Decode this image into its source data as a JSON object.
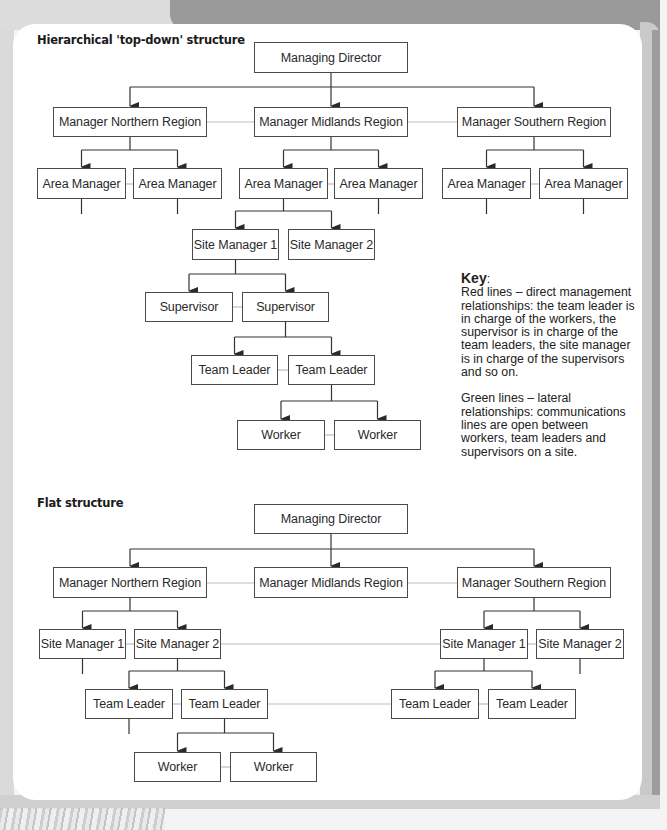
{
  "colors": {
    "direct_line": "#333333",
    "lateral_line": "#bdbdbd",
    "box_border": "#4a4a4a"
  },
  "hierarchical": {
    "title": "Hierarchical 'top-down' structure",
    "nodes": [
      {
        "id": "md",
        "label": "Managing Director",
        "x": 254,
        "y": 42,
        "w": 154,
        "h": 31
      },
      {
        "id": "north",
        "label": "Manager Northern Region",
        "x": 53,
        "y": 107,
        "w": 154,
        "h": 30
      },
      {
        "id": "mid",
        "label": "Manager Midlands Region",
        "x": 254,
        "y": 107,
        "w": 154,
        "h": 30
      },
      {
        "id": "south",
        "label": "Manager Southern Region",
        "x": 457,
        "y": 107,
        "w": 154,
        "h": 30
      },
      {
        "id": "n_am1",
        "label": "Area Manager",
        "x": 37,
        "y": 168,
        "w": 89,
        "h": 31
      },
      {
        "id": "n_am2",
        "label": "Area Manager",
        "x": 133,
        "y": 168,
        "w": 89,
        "h": 31
      },
      {
        "id": "m_am1",
        "label": "Area Manager",
        "x": 239,
        "y": 168,
        "w": 89,
        "h": 31
      },
      {
        "id": "m_am2",
        "label": "Area Manager",
        "x": 334,
        "y": 168,
        "w": 89,
        "h": 31
      },
      {
        "id": "s_am1",
        "label": "Area Manager",
        "x": 442,
        "y": 168,
        "w": 89,
        "h": 31
      },
      {
        "id": "s_am2",
        "label": "Area Manager",
        "x": 539,
        "y": 168,
        "w": 89,
        "h": 31
      },
      {
        "id": "sm1",
        "label": "Site Manager 1",
        "x": 192,
        "y": 229,
        "w": 87,
        "h": 31
      },
      {
        "id": "sm2",
        "label": "Site Manager 2",
        "x": 288,
        "y": 229,
        "w": 87,
        "h": 31
      },
      {
        "id": "sup1",
        "label": "Supervisor",
        "x": 145,
        "y": 292,
        "w": 88,
        "h": 30
      },
      {
        "id": "sup2",
        "label": "Supervisor",
        "x": 242,
        "y": 292,
        "w": 87,
        "h": 30
      },
      {
        "id": "tl1",
        "label": "Team Leader",
        "x": 191,
        "y": 355,
        "w": 87,
        "h": 30
      },
      {
        "id": "tl2",
        "label": "Team Leader",
        "x": 288,
        "y": 355,
        "w": 87,
        "h": 30
      },
      {
        "id": "w1",
        "label": "Worker",
        "x": 237,
        "y": 420,
        "w": 88,
        "h": 30
      },
      {
        "id": "w2",
        "label": "Worker",
        "x": 334,
        "y": 420,
        "w": 87,
        "h": 30
      }
    ],
    "direct_links": [
      {
        "from": "md",
        "to": [
          "north",
          "mid",
          "south"
        ],
        "bar_y": 87
      },
      {
        "from": "north",
        "to": [
          "n_am1",
          "n_am2"
        ],
        "bar_y": 150
      },
      {
        "from": "mid",
        "to": [
          "m_am1",
          "m_am2"
        ],
        "bar_y": 150
      },
      {
        "from": "south",
        "to": [
          "s_am1",
          "s_am2"
        ],
        "bar_y": 150
      },
      {
        "from": "m_am1",
        "to": [
          "sm1",
          "sm2"
        ],
        "bar_y": 211
      },
      {
        "from": "sm1",
        "to": [
          "sup1",
          "sup2"
        ],
        "bar_y": 274
      },
      {
        "from": "sup2",
        "to": [
          "tl1",
          "tl2"
        ],
        "bar_y": 337
      },
      {
        "from": "tl2",
        "to": [
          "w1",
          "w2"
        ],
        "bar_y": 401
      }
    ],
    "stubs": [
      "n_am1",
      "n_am2",
      "m_am2",
      "s_am1",
      "s_am2"
    ],
    "lateral_links": [
      [
        "north",
        "mid"
      ],
      [
        "mid",
        "south"
      ],
      [
        "n_am1",
        "n_am2"
      ],
      [
        "m_am1",
        "m_am2"
      ],
      [
        "s_am1",
        "s_am2"
      ],
      [
        "sup1",
        "sup2"
      ],
      [
        "tl1",
        "tl2"
      ],
      [
        "w1",
        "w2"
      ]
    ]
  },
  "key": {
    "title": "Key",
    "title_suffix": ":",
    "red_lines": "Red lines – direct management relationships: the team leader is in charge of the workers, the supervisor is in charge of the team leaders, the site manager is in charge of the supervisors and so on.",
    "green_lines": "Green lines – lateral relationships: communications lines are open between workers, team leaders and supervisors on a site."
  },
  "flat": {
    "title": "Flat structure",
    "nodes": [
      {
        "id": "md",
        "label": "Managing Director",
        "x": 254,
        "y": 504,
        "w": 154,
        "h": 30
      },
      {
        "id": "north",
        "label": "Manager Northern Region",
        "x": 53,
        "y": 567,
        "w": 154,
        "h": 31
      },
      {
        "id": "mid",
        "label": "Manager Midlands Region",
        "x": 254,
        "y": 567,
        "w": 154,
        "h": 31
      },
      {
        "id": "south",
        "label": "Manager Southern Region",
        "x": 457,
        "y": 567,
        "w": 154,
        "h": 31
      },
      {
        "id": "n_sm1",
        "label": "Site Manager 1",
        "x": 39,
        "y": 629,
        "w": 87,
        "h": 30
      },
      {
        "id": "n_sm2",
        "label": "Site Manager 2",
        "x": 134,
        "y": 629,
        "w": 87,
        "h": 30
      },
      {
        "id": "s_sm1",
        "label": "Site Manager 1",
        "x": 440,
        "y": 629,
        "w": 88,
        "h": 30
      },
      {
        "id": "s_sm2",
        "label": "Site Manager 2",
        "x": 536,
        "y": 629,
        "w": 88,
        "h": 30
      },
      {
        "id": "n_tl1",
        "label": "Team Leader",
        "x": 85,
        "y": 689,
        "w": 88,
        "h": 30
      },
      {
        "id": "n_tl2",
        "label": "Team Leader",
        "x": 181,
        "y": 689,
        "w": 87,
        "h": 30
      },
      {
        "id": "s_tl1",
        "label": "Team Leader",
        "x": 391,
        "y": 689,
        "w": 88,
        "h": 30
      },
      {
        "id": "s_tl2",
        "label": "Team Leader",
        "x": 488,
        "y": 689,
        "w": 88,
        "h": 30
      },
      {
        "id": "w1",
        "label": "Worker",
        "x": 134,
        "y": 752,
        "w": 87,
        "h": 30
      },
      {
        "id": "w2",
        "label": "Worker",
        "x": 230,
        "y": 752,
        "w": 87,
        "h": 30
      }
    ],
    "direct_links": [
      {
        "from": "md",
        "to": [
          "north",
          "mid",
          "south"
        ],
        "bar_y": 549
      },
      {
        "from": "north",
        "to": [
          "n_sm1",
          "n_sm2"
        ],
        "bar_y": 611
      },
      {
        "from": "south",
        "to": [
          "s_sm1",
          "s_sm2"
        ],
        "bar_y": 611
      },
      {
        "from": "n_sm2",
        "to": [
          "n_tl1",
          "n_tl2"
        ],
        "bar_y": 671
      },
      {
        "from": "s_sm1",
        "to": [
          "s_tl1",
          "s_tl2"
        ],
        "bar_y": 671
      },
      {
        "from": "n_tl2",
        "to": [
          "w1",
          "w2"
        ],
        "bar_y": 733
      }
    ],
    "stubs": [
      "n_sm1",
      "s_sm2",
      "n_tl1"
    ],
    "lateral_links": [
      [
        "north",
        "mid"
      ],
      [
        "mid",
        "south"
      ],
      [
        "n_sm1",
        "n_sm2"
      ],
      [
        "n_sm2",
        "s_sm1"
      ],
      [
        "s_sm1",
        "s_sm2"
      ],
      [
        "n_tl1",
        "n_tl2"
      ],
      [
        "n_tl2",
        "s_tl1"
      ],
      [
        "s_tl1",
        "s_tl2"
      ],
      [
        "w1",
        "w2"
      ]
    ]
  }
}
